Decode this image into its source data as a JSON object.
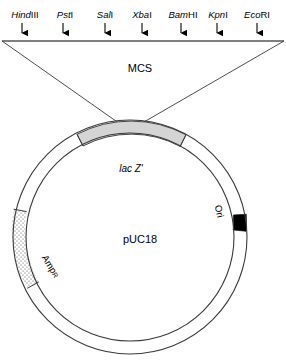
{
  "figure": {
    "title_plasmid": "pUC18",
    "mcs_label": "MCS"
  },
  "mcs": {
    "label": "MCS",
    "line": {
      "y": 40,
      "x_start": 2,
      "x_end": 284
    },
    "sites": [
      {
        "name": "HindIII",
        "italic_part": "Hind",
        "roman_part": "III",
        "x": 22,
        "label_x": 25
      },
      {
        "name": "PstI",
        "italic_part": "Pst",
        "roman_part": "I",
        "x": 63,
        "label_x": 65
      },
      {
        "name": "SalI",
        "italic_part": "Sal",
        "roman_part": "I",
        "x": 105,
        "label_x": 105
      },
      {
        "name": "XbaI",
        "italic_part": "Xba",
        "roman_part": "I",
        "x": 142,
        "label_x": 142
      },
      {
        "name": "BamHI",
        "italic_part": "Bam",
        "roman_part": "HI",
        "x": 181,
        "label_x": 183
      },
      {
        "name": "KpnI",
        "italic_part": "Kpn",
        "roman_part": "I",
        "x": 217,
        "label_x": 218
      },
      {
        "name": "EcoRI",
        "italic_part": "Eco",
        "roman_part": "RI",
        "x": 257,
        "label_x": 257
      }
    ]
  },
  "plasmid": {
    "name": "pUC18",
    "center_x": 130,
    "center_y": 237,
    "outer_radius": 117,
    "inner_radius": 104,
    "features": [
      {
        "id": "lacz",
        "label": "lac Z'",
        "type": "arc-segment",
        "fill_style": "grey",
        "fill_color": "#d4d4d4",
        "label_x": 131,
        "label_y": 168
      },
      {
        "id": "ori",
        "label": "Ori",
        "type": "arc-segment",
        "fill_style": "solid-black",
        "fill_color": "#000000",
        "label_x": 216,
        "label_y": 212
      },
      {
        "id": "ampr",
        "label": "AmpR",
        "label_main": "Amp",
        "label_sub": "R",
        "type": "arc-segment",
        "fill_style": "stippled",
        "fill_color": "#ffffff",
        "label_x": 48,
        "label_y": 268
      }
    ]
  },
  "funnel": {
    "left_top_x": 2,
    "right_top_x": 284,
    "top_y": 41,
    "apex_left_x": 123,
    "apex_right_x": 137,
    "apex_y": 126
  },
  "colors": {
    "stroke": "#1a1a1a",
    "lacz_fill": "#d4d4d4",
    "ori_fill": "#000000",
    "background": "#ffffff"
  }
}
